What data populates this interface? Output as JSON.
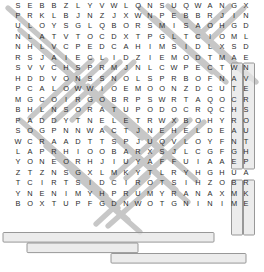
{
  "puzzle": {
    "type": "word-search",
    "columns": 22,
    "rows": 26,
    "cell_width": 12,
    "cell_height": 10.46,
    "colors": {
      "letter": "#2b2b2b",
      "background": "#ffffff",
      "strike_line": "#8d8d8d",
      "box_outline": "#8d8d8d",
      "box_fill": "#e8e8e8"
    },
    "grid": [
      "SEBBZLYVWLQNSUQWANGX",
      "PRKLBJNZJXWNPEBBRJIN",
      "ULOYSGLQBORSMISAOHGD",
      "NLATVTOCDXTPGLTCIOML",
      "NHLVCPEDCAHIMSIDLXSD",
      "RSJAIECLIDZIEMODTMAE",
      "SVVCHSPRMJNLCWPECTWN",
      "HDDVONSSNOLSPRBOFNAV",
      "PCALOWWIOEMOONZDCUTE",
      "MGCOIRGOBRPSWRTAQOCR",
      "BHLNSORATUPODOCRQCHS",
      "PADDYTNELETRWXBOHYRO",
      "SOGPNNWACTJNEHELDEAU",
      "WCRAADTTSPJUQVLOYFNT",
      "LAPRHIOOBARXSJLCGFGH",
      "YONEORHJIUYAFFUIAAEP",
      "ZTZNSGXLMKYTLRYHGHUA",
      "TCIRTSIDCIROTSIHZOBR",
      "YNENIMYHPRUMYRANAXMK",
      "BOXTUPFGDNWOTGNINIME"
    ],
    "grid_rows": [
      [
        "S",
        "E",
        "B",
        "B",
        "Z",
        "L",
        "Y",
        "V",
        "W",
        "L",
        "Q",
        "N",
        "S",
        "U",
        "Q",
        "W",
        "A",
        "N",
        "G",
        "X"
      ],
      [
        "P",
        "R",
        "K",
        "L",
        "B",
        "J",
        "N",
        "Z",
        "J",
        "X",
        "W",
        "N",
        "P",
        "E",
        "B",
        "B",
        "R",
        "J",
        "I",
        "N"
      ],
      [
        "U",
        "L",
        "O",
        "Y",
        "S",
        "G",
        "L",
        "Q",
        "B",
        "O",
        "R",
        "S",
        "M",
        "I",
        "S",
        "A",
        "O",
        "H",
        "G",
        "D"
      ],
      [
        "N",
        "L",
        "A",
        "T",
        "V",
        "T",
        "O",
        "C",
        "D",
        "X",
        "T",
        "P",
        "G",
        "L",
        "T",
        "C",
        "I",
        "O",
        "M",
        "L"
      ],
      [
        "N",
        "H",
        "L",
        "V",
        "C",
        "P",
        "E",
        "D",
        "C",
        "A",
        "H",
        "I",
        "M",
        "S",
        "I",
        "D",
        "L",
        "X",
        "S",
        "D"
      ],
      [
        "R",
        "S",
        "J",
        "A",
        "I",
        "E",
        "C",
        "L",
        "I",
        "D",
        "Z",
        "I",
        "E",
        "M",
        "O",
        "D",
        "T",
        "M",
        "A",
        "E"
      ],
      [
        "S",
        "V",
        "V",
        "C",
        "H",
        "S",
        "P",
        "R",
        "M",
        "J",
        "N",
        "L",
        "C",
        "W",
        "P",
        "E",
        "C",
        "T",
        "W",
        "N"
      ],
      [
        "H",
        "D",
        "D",
        "V",
        "O",
        "N",
        "S",
        "S",
        "N",
        "O",
        "L",
        "S",
        "P",
        "R",
        "B",
        "O",
        "F",
        "N",
        "A",
        "V"
      ],
      [
        "P",
        "C",
        "A",
        "L",
        "O",
        "W",
        "W",
        "I",
        "O",
        "E",
        "M",
        "O",
        "O",
        "N",
        "Z",
        "D",
        "C",
        "U",
        "T",
        "E"
      ],
      [
        "M",
        "G",
        "C",
        "O",
        "I",
        "R",
        "G",
        "O",
        "B",
        "R",
        "P",
        "S",
        "W",
        "R",
        "T",
        "A",
        "Q",
        "O",
        "C",
        "R"
      ],
      [
        "B",
        "H",
        "L",
        "N",
        "S",
        "O",
        "R",
        "A",
        "T",
        "U",
        "P",
        "O",
        "D",
        "O",
        "C",
        "R",
        "Q",
        "C",
        "H",
        "S"
      ],
      [
        "P",
        "A",
        "D",
        "D",
        "Y",
        "T",
        "N",
        "E",
        "L",
        "E",
        "T",
        "R",
        "W",
        "X",
        "B",
        "O",
        "H",
        "Y",
        "R",
        "O"
      ],
      [
        "S",
        "O",
        "G",
        "P",
        "N",
        "N",
        "W",
        "A",
        "C",
        "T",
        "J",
        "N",
        "E",
        "H",
        "E",
        "L",
        "D",
        "E",
        "A",
        "U"
      ],
      [
        "W",
        "C",
        "R",
        "A",
        "A",
        "D",
        "T",
        "T",
        "S",
        "P",
        "J",
        "U",
        "Q",
        "V",
        "L",
        "O",
        "Y",
        "F",
        "N",
        "T"
      ],
      [
        "L",
        "A",
        "P",
        "R",
        "H",
        "I",
        "O",
        "O",
        "B",
        "A",
        "R",
        "X",
        "S",
        "J",
        "L",
        "C",
        "G",
        "F",
        "G",
        "H"
      ],
      [
        "Y",
        "O",
        "N",
        "E",
        "O",
        "R",
        "H",
        "J",
        "I",
        "U",
        "Y",
        "A",
        "F",
        "F",
        "U",
        "I",
        "A",
        "A",
        "E",
        "P"
      ],
      [
        "Z",
        "T",
        "Z",
        "N",
        "S",
        "G",
        "X",
        "L",
        "M",
        "K",
        "Y",
        "T",
        "L",
        "R",
        "Y",
        "H",
        "G",
        "H",
        "U",
        "A"
      ],
      [
        "T",
        "C",
        "I",
        "R",
        "T",
        "S",
        "I",
        "D",
        "C",
        "I",
        "R",
        "O",
        "T",
        "S",
        "I",
        "H",
        "Z",
        "O",
        "B",
        "R"
      ],
      [
        "Y",
        "N",
        "E",
        "N",
        "I",
        "M",
        "Y",
        "H",
        "P",
        "R",
        "U",
        "M",
        "Y",
        "R",
        "A",
        "N",
        "A",
        "X",
        "M",
        "K"
      ],
      [
        "B",
        "O",
        "X",
        "T",
        "U",
        "P",
        "F",
        "G",
        "D",
        "N",
        "W",
        "O",
        "T",
        "G",
        "N",
        "I",
        "N",
        "I",
        "M",
        "E"
      ]
    ],
    "found_words": [
      {
        "text": "HISTORIC DISTRICT",
        "row": 17,
        "col_start": 0,
        "col_end": 17,
        "direction": "reversed-horizontal"
      },
      {
        "text": "MURPHY MINE",
        "row": 18,
        "col_start": 2,
        "col_end": 10,
        "direction": "reversed-horizontal"
      },
      {
        "text": "MINING TOWN",
        "row": 19,
        "col_start": 9,
        "col_end": 19,
        "direction": "reversed-horizontal"
      },
      {
        "text": "ARIZONA",
        "row_start": 18,
        "col": 19,
        "direction": "vertical"
      },
      {
        "text": "COURTHOUSE",
        "col": 19,
        "direction": "vertical"
      }
    ]
  },
  "labels": {
    "grid_label": "letter-grid",
    "strike_label": "solution-strike-through"
  }
}
